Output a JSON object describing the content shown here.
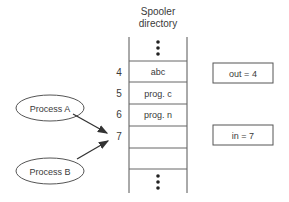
{
  "title": {
    "line1": "Spooler",
    "line2": "directory"
  },
  "slots": [
    {
      "index": "4",
      "value": "abc"
    },
    {
      "index": "5",
      "value": "prog. c"
    },
    {
      "index": "6",
      "value": "prog. n"
    },
    {
      "index": "7",
      "value": ""
    }
  ],
  "variables": {
    "out": "out = 4",
    "in": "in = 7"
  },
  "processes": {
    "a": "Process A",
    "b": "Process B"
  },
  "colors": {
    "line": "#555555",
    "text": "#3a3a3a"
  }
}
